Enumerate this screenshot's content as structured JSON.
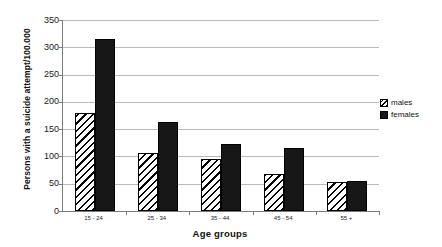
{
  "chart_data": {
    "type": "bar",
    "title": "",
    "xlabel": "Age groups",
    "ylabel": "Persons with a suicide attempt/100.000",
    "categories": [
      "15 - 24",
      "25 - 34",
      "35 - 44",
      "45 - 54",
      "55 +"
    ],
    "series": [
      {
        "name": "males",
        "values": [
          180,
          107,
          96,
          67,
          54
        ]
      },
      {
        "name": "females",
        "values": [
          315,
          163,
          122,
          115,
          55
        ]
      }
    ],
    "ylim": [
      0,
      350
    ],
    "yticks": [
      0,
      50,
      100,
      150,
      200,
      250,
      300,
      350
    ],
    "ytick_labels": [
      "0",
      "50",
      "100",
      "150",
      "200",
      "250",
      "300",
      "350"
    ],
    "grid": true,
    "legend_position": "right",
    "legend": [
      {
        "label": "males",
        "pattern": "diagonal-hatch",
        "color": "#ffffff"
      },
      {
        "label": "females",
        "pattern": "solid",
        "color": "#171717"
      }
    ],
    "colors": {
      "males_fill": "#ffffff",
      "females_fill": "#171717",
      "bar_outline": "#000000",
      "gridline": "#b9b9b9",
      "axis": "#7a7a7a",
      "background": "#ffffff"
    }
  }
}
